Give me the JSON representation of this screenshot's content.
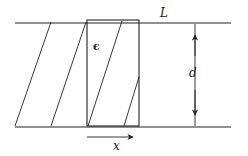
{
  "diagram": {
    "labels": {
      "plate_length": "L",
      "plate_separation": "d",
      "permittivity": "ϵ",
      "insertion_distance": "x"
    },
    "colors": {
      "line": "#222222",
      "background": "#ffffff"
    }
  }
}
